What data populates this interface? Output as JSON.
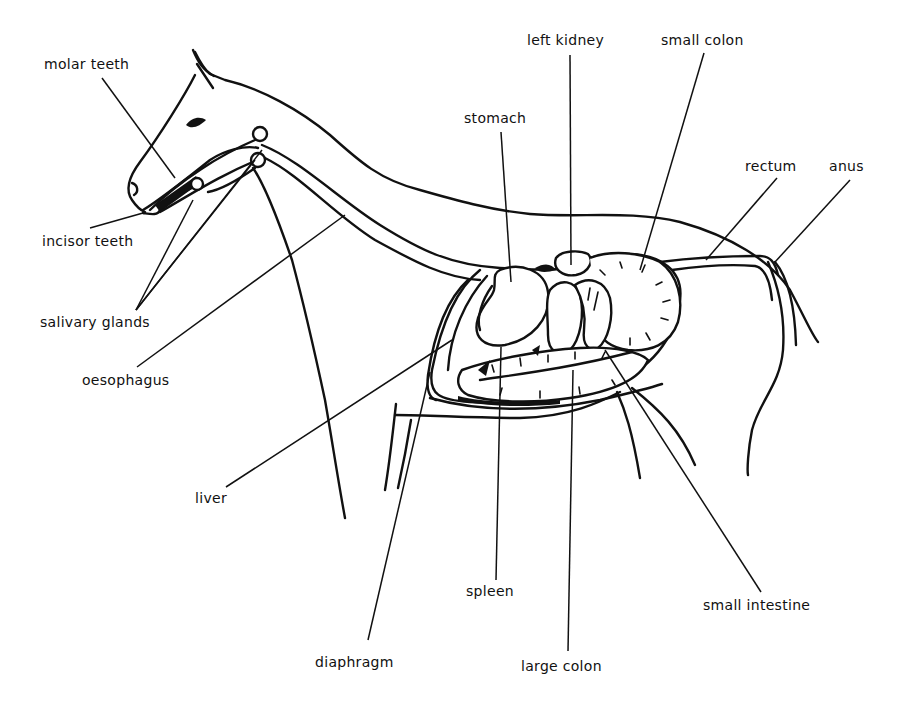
{
  "diagram": {
    "colors": {
      "ink": "#111111",
      "background": "#ffffff"
    },
    "labels": [
      {
        "id": "molar-teeth",
        "text": "molar teeth",
        "x": 44,
        "y": 56,
        "line": [
          102,
          78,
          175,
          178
        ]
      },
      {
        "id": "incisor-teeth",
        "text": "incisor teeth",
        "x": 42,
        "y": 233,
        "line": [
          90,
          228,
          143,
          213
        ]
      },
      {
        "id": "salivary-glands",
        "text": "salivary glands",
        "x": 40,
        "y": 314,
        "line": [
          136,
          310,
          193,
          200
        ],
        "extra_lines": [
          [
            136,
            310,
            255,
            160
          ],
          [
            136,
            310,
            262,
            150
          ]
        ]
      },
      {
        "id": "oesophagus",
        "text": "oesophagus",
        "x": 82,
        "y": 372,
        "line": [
          137,
          367,
          345,
          215
        ]
      },
      {
        "id": "stomach",
        "text": "stomach",
        "x": 464,
        "y": 110,
        "line": [
          501,
          132,
          511,
          282
        ]
      },
      {
        "id": "left-kidney",
        "text": "left kidney",
        "x": 527,
        "y": 32,
        "line": [
          570,
          55,
          571,
          265
        ]
      },
      {
        "id": "small-colon",
        "text": "small colon",
        "x": 661,
        "y": 32,
        "line": [
          704,
          53,
          640,
          270
        ]
      },
      {
        "id": "rectum",
        "text": "rectum",
        "x": 745,
        "y": 158,
        "line": [
          777,
          178,
          706,
          260
        ]
      },
      {
        "id": "anus",
        "text": "anus",
        "x": 829,
        "y": 158,
        "line": [
          850,
          180,
          775,
          262
        ]
      },
      {
        "id": "liver",
        "text": "liver",
        "x": 195,
        "y": 490,
        "line": [
          226,
          487,
          452,
          340
        ]
      },
      {
        "id": "spleen",
        "text": "spleen",
        "x": 466,
        "y": 583,
        "line": [
          496,
          580,
          501,
          347
        ]
      },
      {
        "id": "small-intestine",
        "text": "small intestine",
        "x": 703,
        "y": 597,
        "line": [
          761,
          592,
          605,
          350
        ]
      },
      {
        "id": "diaphragm",
        "text": "diaphragm",
        "x": 315,
        "y": 654,
        "line": [
          368,
          640,
          430,
          372
        ]
      },
      {
        "id": "large-colon",
        "text": "large colon",
        "x": 521,
        "y": 658,
        "line": [
          568,
          651,
          573,
          370
        ]
      }
    ]
  }
}
